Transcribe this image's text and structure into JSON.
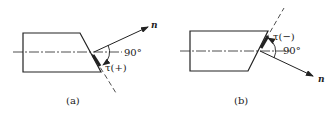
{
  "figures": [
    {
      "id": "a",
      "caption": "(a)",
      "normal_label": "n",
      "right_angle_label": "90°",
      "angle_label": "τ(+)"
    },
    {
      "id": "b",
      "caption": "(b)",
      "normal_label": "n",
      "right_angle_label": "90°",
      "angle_label": "τ(−)"
    }
  ],
  "colors": {
    "line": "#222222",
    "background": "#ffffff"
  }
}
